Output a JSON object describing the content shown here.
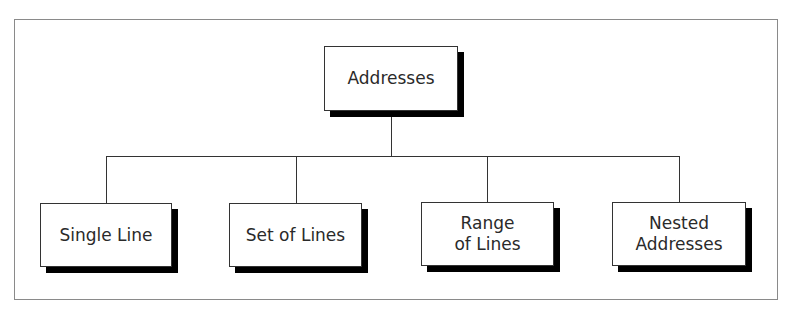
{
  "diagram": {
    "type": "hierarchy",
    "root": {
      "label": "Addresses"
    },
    "children": [
      {
        "label": "Single Line"
      },
      {
        "label": "Set of Lines"
      },
      {
        "label": "Range\nof Lines"
      },
      {
        "label": "Nested\nAddresses"
      }
    ],
    "colors": {
      "frame": "#8a8a8a",
      "box_border": "#333333",
      "shadow": "#000000",
      "text": "#2a2a2a"
    }
  }
}
